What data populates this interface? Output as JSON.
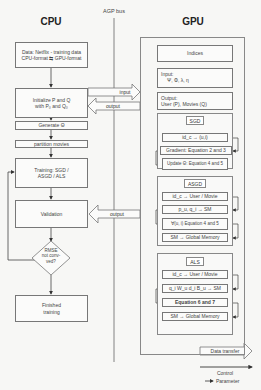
{
  "header": {
    "cpu_title": "CPU",
    "gpu_title": "GPU",
    "bus_label": "AGP bus"
  },
  "cpu": {
    "data_box": {
      "line1": "Data: Netflix - training data",
      "line2": "CPU-format ⇆ GPU-format"
    },
    "init_box": {
      "line1": "Initialize P and Q",
      "line2": "with P₀ and Q₀"
    },
    "generate_box": "Generate Θ",
    "partition_box": "partition movies",
    "training_box": {
      "line1": "Training: SGD /",
      "line2": "ASGD / ALS"
    },
    "validation_box": "Validation",
    "decision": {
      "line1": "RMSE",
      "line2": "not conv-",
      "line3": "ved?"
    },
    "finished_box": {
      "line1": "Finished",
      "line2": "training"
    }
  },
  "bus_arrows": {
    "input": "input",
    "output_top": "output",
    "output_validation": "output"
  },
  "gpu": {
    "indices": "Indices",
    "input": {
      "label": "Input:",
      "value": "Ψ, Φ, λ, η"
    },
    "output": {
      "label": "Output:",
      "value": "User (P), Movies (Q)"
    },
    "sgd": {
      "tag": "SGD",
      "steps": [
        "id_c → (u,i)",
        "Gradient: Equation 2 and 3",
        "Update Θ: Equation 4 and 5"
      ]
    },
    "asgd": {
      "tag": "ASGD",
      "steps": [
        "id_c → User / Movie",
        "p_u, q_i → SM",
        "∀(u, i) Equation 4 and 5",
        "SM → Global Memory"
      ]
    },
    "als": {
      "tag": "ALS",
      "steps": [
        "id_c → User / Movie",
        "q_i W_u d_i B_u → SM",
        "Equation 6 and 7",
        "SM → Global Memory"
      ]
    }
  },
  "legend": {
    "data_transfer": "Data transfer",
    "control": "Control",
    "parameter": "Parameter"
  },
  "colors": {
    "line": "#555555",
    "box_border": "#777777",
    "background": "#f7f7f5"
  }
}
